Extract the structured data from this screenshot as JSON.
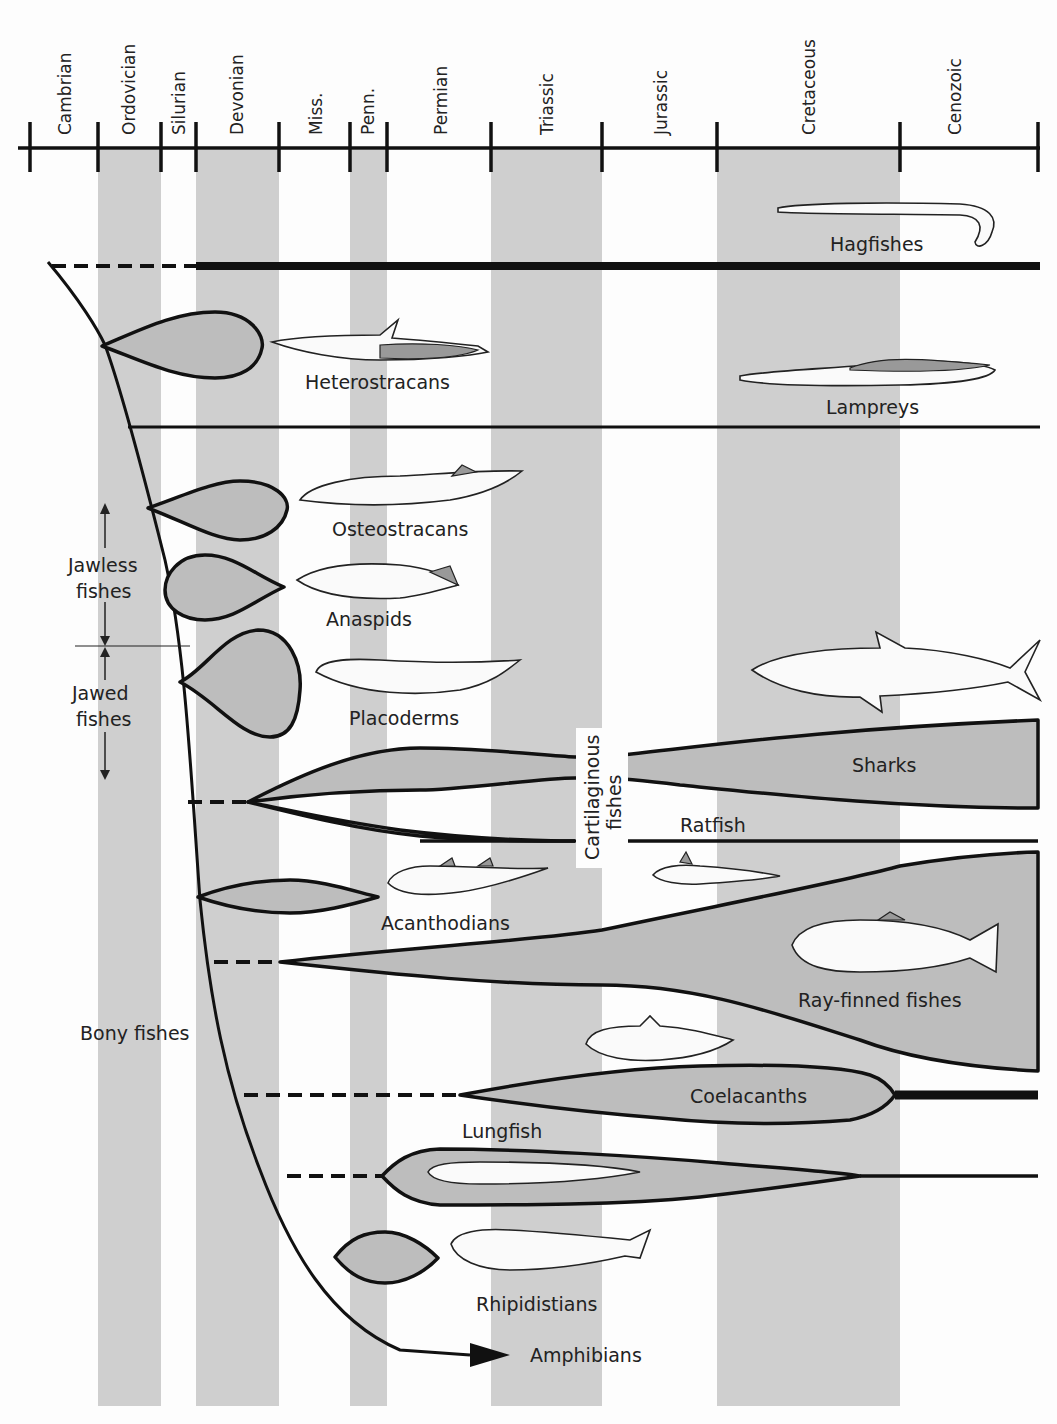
{
  "timeline": {
    "periods": [
      {
        "name": "Cambrian",
        "x1": 30,
        "x2": 98,
        "shaded": false
      },
      {
        "name": "Ordovician",
        "x1": 98,
        "x2": 161,
        "shaded": true
      },
      {
        "name": "Silurian",
        "x1": 161,
        "x2": 196,
        "shaded": false
      },
      {
        "name": "Devonian",
        "x1": 196,
        "x2": 279,
        "shaded": true
      },
      {
        "name": "Miss.",
        "x1": 279,
        "x2": 350,
        "shaded": false
      },
      {
        "name": "Penn.",
        "x1": 350,
        "x2": 387,
        "shaded": true
      },
      {
        "name": "Permian",
        "x1": 387,
        "x2": 491,
        "shaded": false
      },
      {
        "name": "Triassic",
        "x1": 491,
        "x2": 602,
        "shaded": true
      },
      {
        "name": "Jurassic",
        "x1": 602,
        "x2": 717,
        "shaded": false
      },
      {
        "name": "Cretaceous",
        "x1": 717,
        "x2": 900,
        "shaded": true
      },
      {
        "name": "Cenozoic",
        "x1": 900,
        "x2": 1038,
        "shaded": false
      }
    ]
  },
  "groups": {
    "jawless": "Jawless fishes",
    "jawless_l1": "Jawless",
    "jawless_l2": "fishes",
    "jawed": "Jawed fishes",
    "jawed_l1": "Jawed",
    "jawed_l2": "fishes",
    "bony": "Bony fishes",
    "cartilaginous_l1": "Cartilaginous",
    "cartilaginous_l2": "fishes"
  },
  "taxa": {
    "hagfishes": "Hagfishes",
    "heterostracans": "Heterostracans",
    "lampreys": "Lampreys",
    "osteostracans": "Osteostracans",
    "anaspids": "Anaspids",
    "placoderms": "Placoderms",
    "sharks": "Sharks",
    "ratfish": "Ratfish",
    "acanthodians": "Acanthodians",
    "ray_finned": "Ray-finned fishes",
    "coelacanths": "Coelacanths",
    "lungfish": "Lungfish",
    "rhipidistians": "Rhipidistians",
    "amphibians": "Amphibians"
  },
  "colors": {
    "band": "#cfcfcf",
    "clade_fill": "#bdbdbd",
    "line": "#111111",
    "background": "#fdfdfd"
  }
}
